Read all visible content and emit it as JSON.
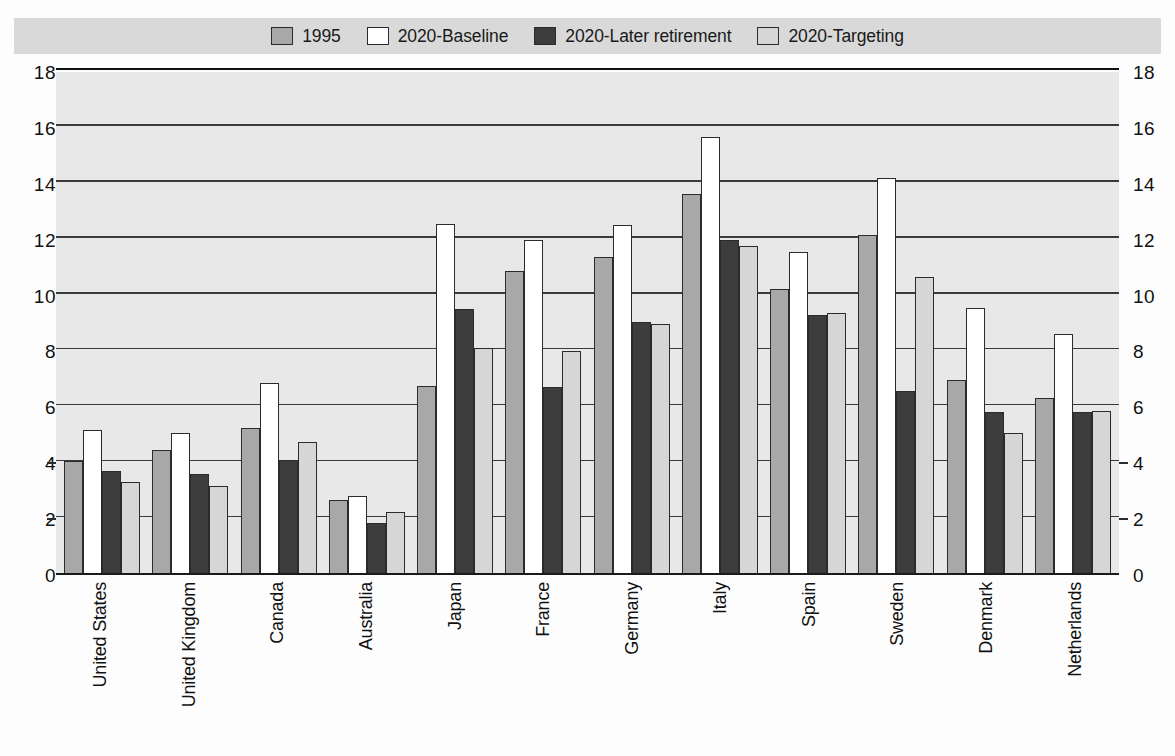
{
  "legend": {
    "items": [
      {
        "label": "1995",
        "color": "#a8a8a8",
        "swatch": "legend-swatch-1995"
      },
      {
        "label": "2020-Baseline",
        "color": "#ffffff",
        "swatch": "legend-swatch-2020-baseline"
      },
      {
        "label": "2020-Later retirement",
        "color": "#3d3d3d",
        "swatch": "legend-swatch-2020-later-retirement"
      },
      {
        "label": "2020-Targeting",
        "color": "#d6d6d6",
        "swatch": "legend-swatch-2020-targeting"
      }
    ]
  },
  "axis": {
    "ticks": [
      "18",
      "16",
      "14",
      "12",
      "10",
      "8",
      "6",
      "4",
      "2",
      "0"
    ]
  },
  "chart_data": {
    "type": "bar",
    "title": "",
    "subtitle": "",
    "xlabel": "",
    "ylabel": "",
    "ylim": [
      0,
      18
    ],
    "ytick_step": 2,
    "grid": true,
    "legend_position": "top",
    "categories": [
      "United States",
      "United Kingdom",
      "Canada",
      "Australia",
      "Japan",
      "France",
      "Germany",
      "Italy",
      "Spain",
      "Sweden",
      "Denmark",
      "Netherlands"
    ],
    "series": [
      {
        "name": "1995",
        "color": "#a8a8a8",
        "values": [
          4.0,
          4.4,
          5.2,
          2.6,
          6.7,
          10.8,
          11.3,
          13.55,
          10.15,
          12.1,
          6.9,
          6.25
        ]
      },
      {
        "name": "2020-Baseline",
        "color": "#ffffff",
        "values": [
          5.1,
          5.0,
          6.8,
          2.75,
          12.5,
          11.9,
          12.45,
          15.6,
          11.5,
          14.15,
          9.5,
          8.55
        ]
      },
      {
        "name": "2020-Later retirement",
        "color": "#3d3d3d",
        "values": [
          3.65,
          3.55,
          4.05,
          1.8,
          9.45,
          6.65,
          9.0,
          11.9,
          9.25,
          6.5,
          5.75,
          5.75
        ]
      },
      {
        "name": "2020-Targeting",
        "color": "#d6d6d6",
        "values": [
          3.25,
          3.1,
          4.7,
          2.2,
          8.05,
          7.95,
          8.9,
          11.7,
          9.3,
          10.6,
          5.0,
          5.8
        ]
      }
    ]
  }
}
